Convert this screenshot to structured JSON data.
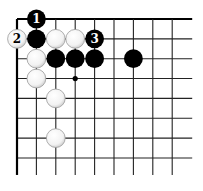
{
  "diagram": {
    "type": "go-board-corner",
    "grid": {
      "origin_x": 17,
      "origin_y": 19,
      "spacing_x": 19.4,
      "spacing_y": 19.85,
      "cols": 9,
      "rows": 8,
      "line_color": "#222222",
      "edge_color": "#000000"
    },
    "star_points": [
      {
        "col": 3,
        "row": 3
      }
    ],
    "stones": [
      {
        "color": "black",
        "col": 1,
        "row": 0,
        "label": "1"
      },
      {
        "color": "white",
        "col": 0,
        "row": 1,
        "label": "2"
      },
      {
        "color": "black",
        "col": 1,
        "row": 1,
        "label": ""
      },
      {
        "color": "white",
        "col": 2,
        "row": 1,
        "label": ""
      },
      {
        "color": "white",
        "col": 3,
        "row": 1,
        "label": ""
      },
      {
        "color": "black",
        "col": 4,
        "row": 1,
        "label": "3"
      },
      {
        "color": "white",
        "col": 1,
        "row": 2,
        "label": ""
      },
      {
        "color": "black",
        "col": 2,
        "row": 2,
        "label": ""
      },
      {
        "color": "black",
        "col": 3,
        "row": 2,
        "label": ""
      },
      {
        "color": "black",
        "col": 4,
        "row": 2,
        "label": ""
      },
      {
        "color": "black",
        "col": 6,
        "row": 2,
        "label": ""
      },
      {
        "color": "white",
        "col": 1,
        "row": 3,
        "label": ""
      },
      {
        "color": "white",
        "col": 2,
        "row": 4,
        "label": ""
      },
      {
        "color": "white",
        "col": 2,
        "row": 6,
        "label": ""
      }
    ],
    "colors": {
      "black_stone": "#000000",
      "white_stone_fill": "#ffffff",
      "white_stone_shade": "#c8c8c8",
      "white_stone_stroke": "#9a9a9a",
      "black_label": "#ffffff",
      "white_label": "#000000"
    }
  }
}
